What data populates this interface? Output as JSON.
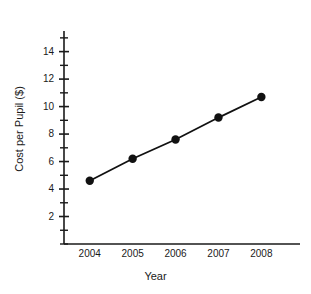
{
  "figure": {
    "clipped_title_fragment": "",
    "background_color": "#ffffff",
    "ink_color": "#1a1a1a"
  },
  "chart_data": {
    "type": "line",
    "title": "",
    "xlabel": "Year",
    "ylabel": "Cost per Pupil ($)",
    "categories": [
      "2004",
      "2005",
      "2006",
      "2007",
      "2008"
    ],
    "x": [
      2004,
      2005,
      2006,
      2007,
      2008
    ],
    "values": [
      4.6,
      6.2,
      7.6,
      9.2,
      10.7
    ],
    "series": [
      {
        "name": "Cost per Pupil ($)",
        "values": [
          4.6,
          6.2,
          7.6,
          9.2,
          10.7
        ],
        "marker": "filled-circle",
        "marker_color": "#111111",
        "line_color": "#111111"
      }
    ],
    "xlim": [
      2003.4,
      2008.9
    ],
    "ylim": [
      0,
      15.5
    ],
    "ytick_labels": [
      "2",
      "4",
      "6",
      "8",
      "10",
      "12",
      "14"
    ],
    "ytick_values": [
      2,
      4,
      6,
      8,
      10,
      12,
      14
    ],
    "yminor_tick_values": [
      1,
      3,
      5,
      7,
      9,
      11,
      13,
      15
    ],
    "ytick_bottom_value": 0,
    "xtick_labels": [
      "2004",
      "2005",
      "2006",
      "2007",
      "2008"
    ],
    "grid": false,
    "legend": false,
    "legend_position": "none"
  }
}
